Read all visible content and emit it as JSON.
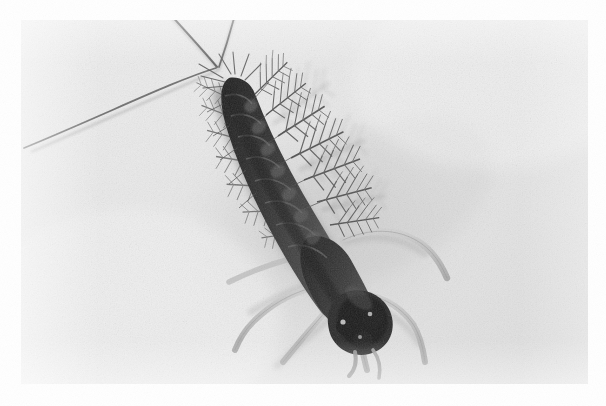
{
  "image": {
    "kind": "photograph",
    "medium": "black-and-white halftone print",
    "subject": "mayfly nymph (aquatic insect larva)",
    "orientation": "landscape",
    "width_px": 606,
    "height_px": 406,
    "photo_inset": {
      "left": 21,
      "top": 20,
      "width": 567,
      "height": 364
    },
    "page_background_color": "#ffffff",
    "photo_background_color": "#e9e9e9",
    "body_dark_color": "#1d1d1d",
    "body_mid_color": "#3a3a3a",
    "appendage_color": "#b9b9b9",
    "bristle_color": "#4a4a4a"
  },
  "subject": {
    "name": "mayfly-nymph",
    "body_axis_degrees": 52,
    "head_position": {
      "x": 336,
      "y": 300
    },
    "abdomen_tip_position": {
      "x": 216,
      "y": 68
    },
    "segment_count": 9,
    "cerci_count": 3,
    "leg_count": 6,
    "gill_pairs": 7,
    "eye_count": 2
  },
  "anatomy": {
    "abdomen_segments": [
      {
        "cx": 222,
        "cy": 80,
        "rx": 15,
        "ry": 12,
        "tone": "#2c2c2c"
      },
      {
        "cx": 232,
        "cy": 99,
        "rx": 17,
        "ry": 13,
        "tone": "#252525"
      },
      {
        "cx": 243,
        "cy": 118,
        "rx": 18,
        "ry": 13,
        "tone": "#222222"
      },
      {
        "cx": 255,
        "cy": 137,
        "rx": 19,
        "ry": 14,
        "tone": "#1f1f1f"
      },
      {
        "cx": 267,
        "cy": 157,
        "rx": 20,
        "ry": 14,
        "tone": "#1c1c1c"
      },
      {
        "cx": 280,
        "cy": 177,
        "rx": 21,
        "ry": 15,
        "tone": "#1e1e1e"
      },
      {
        "cx": 293,
        "cy": 198,
        "rx": 22,
        "ry": 15,
        "tone": "#202020"
      },
      {
        "cx": 306,
        "cy": 219,
        "rx": 23,
        "ry": 16,
        "tone": "#232323"
      },
      {
        "cx": 319,
        "cy": 241,
        "rx": 24,
        "ry": 16,
        "tone": "#212121"
      }
    ],
    "cerci": [
      {
        "name": "cercus-left",
        "d": "M216,68 L24,146",
        "width": 1.7
      },
      {
        "name": "cercus-middle",
        "d": "M216,68 L156,0",
        "width": 1.9
      },
      {
        "name": "cercus-right",
        "d": "M216,68 L236,-6",
        "width": 1.7
      }
    ],
    "legs": [
      {
        "name": "leg-fore-left",
        "d": "M318,286 C300,300 282,314 262,336"
      },
      {
        "name": "leg-fore-right",
        "d": "M330,300 C332,320 336,338 344,362"
      },
      {
        "name": "leg-mid-left",
        "d": "M300,274 C282,282 268,296 256,316"
      },
      {
        "name": "leg-mid-right",
        "d": "M352,296 C372,300 392,312 404,336"
      },
      {
        "name": "leg-hind-left",
        "d": "M286,250 C262,254 240,262 216,276"
      },
      {
        "name": "leg-hind-right",
        "d": "M344,238 C372,230 398,232 420,250"
      }
    ],
    "eyes": [
      {
        "cx": 345,
        "cy": 296,
        "r": 10
      },
      {
        "cx": 325,
        "cy": 308,
        "r": 9
      }
    ]
  }
}
